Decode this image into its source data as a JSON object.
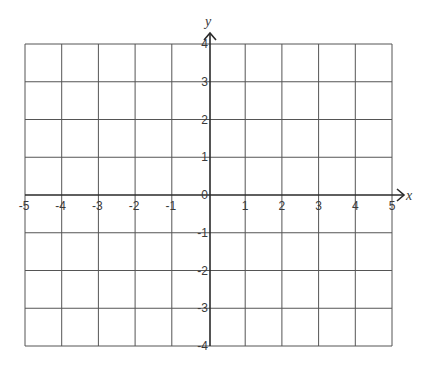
{
  "diagram": {
    "type": "coordinate-plane",
    "x_axis": {
      "label": "x",
      "min": -5,
      "max": 5,
      "step": 1,
      "tick_labels": [
        "-5",
        "-4",
        "-3",
        "-2",
        "-1",
        "1",
        "2",
        "3",
        "4",
        "5"
      ]
    },
    "y_axis": {
      "label": "y",
      "min": -4,
      "max": 4,
      "step": 1,
      "tick_labels": [
        "4",
        "3",
        "2",
        "1",
        "0",
        "-1",
        "-2",
        "-3",
        "-4"
      ]
    },
    "grid": true,
    "colors": {
      "grid": "#555555",
      "axis": "#2a2a2a",
      "text": "#3a3a3a",
      "background": "#ffffff"
    }
  },
  "chart_data": {
    "type": "grid",
    "title": "",
    "xlabel": "x",
    "ylabel": "y",
    "xlim": [
      -5,
      5
    ],
    "ylim": [
      -4,
      4
    ],
    "x_ticks": [
      -5,
      -4,
      -3,
      -2,
      -1,
      1,
      2,
      3,
      4,
      5
    ],
    "y_ticks": [
      -4,
      -3,
      -2,
      -1,
      0,
      1,
      2,
      3,
      4
    ],
    "grid": true,
    "series": []
  }
}
